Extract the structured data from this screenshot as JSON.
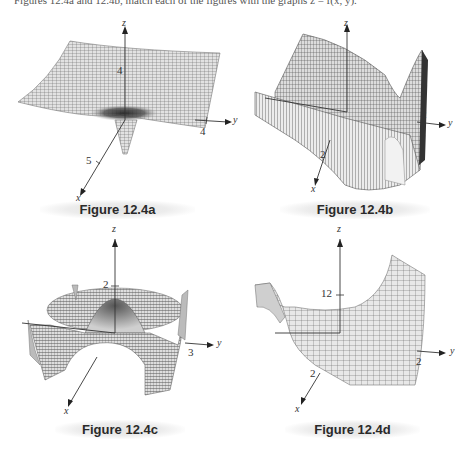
{
  "header": {
    "text": "Figures 12.4a and 12.4b, match each of the figures with the graphs z = f(x, y)."
  },
  "figures": [
    {
      "id": "a",
      "caption": "Figure 12.4a",
      "axes": {
        "x": "x",
        "y": "y",
        "z": "z"
      },
      "ticks": {
        "x": "5",
        "y": "4",
        "z": "4"
      },
      "description": "Flat wide sheet with a narrow downward spike at origin"
    },
    {
      "id": "b",
      "caption": "Figure 12.4b",
      "axes": {
        "x": "x",
        "y": "y",
        "z": "z"
      },
      "ticks": {
        "x": "2",
        "y": "2",
        "z": ""
      },
      "description": "Saddle-like wavy surface rising sharply on right side"
    },
    {
      "id": "c",
      "caption": "Figure 12.4c",
      "axes": {
        "x": "x",
        "y": "y",
        "z": "z"
      },
      "ticks": {
        "x": "",
        "y": "3",
        "z": "2"
      },
      "description": "Radially oscillating surface with central dome and outer ring"
    },
    {
      "id": "d",
      "caption": "Figure 12.4d",
      "axes": {
        "x": "x",
        "y": "y",
        "z": "z"
      },
      "ticks": {
        "x": "2",
        "y": "2",
        "z": "12"
      },
      "description": "Surface flat near origin rising steeply at far corners"
    }
  ],
  "colors": {
    "mesh_line": "#3a3a3a",
    "mesh_fill": "#d9d9d9",
    "axis": "#333333",
    "caption_bg": "#e6e6e6"
  }
}
